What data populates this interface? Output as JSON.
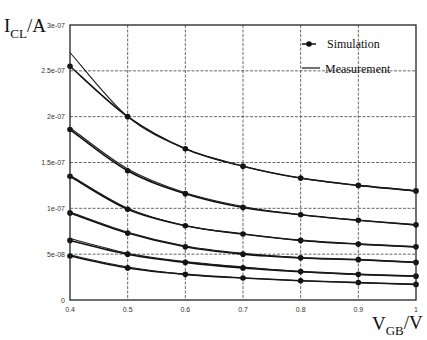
{
  "chart_data": {
    "type": "line",
    "title": "",
    "xlabel": "V_GB /V",
    "ylabel": "I_CL/A",
    "xlim": [
      0.4,
      1.0
    ],
    "ylim": [
      0,
      3e-07
    ],
    "grid": true,
    "legend_position": "upper right",
    "x": [
      0.4,
      0.5,
      0.6,
      0.7,
      0.8,
      0.9,
      1.0
    ],
    "x_tick_labels": [
      "0.4",
      "0.5",
      "0.6",
      "0.7",
      "0.8",
      "0.9",
      "1"
    ],
    "y_tick_values": [
      0,
      5e-08,
      1e-07,
      1.5e-07,
      2e-07,
      2.5e-07,
      3e-07
    ],
    "y_tick_labels": [
      "0",
      "5e-08",
      "1e-07",
      "1.5e-07",
      "2e-07",
      "2.5e-07",
      "3e-07"
    ],
    "legend": [
      {
        "name": "Simulation",
        "style": "line-with-dot-markers"
      },
      {
        "name": "Measurement",
        "style": "solid-line"
      }
    ],
    "series": [
      {
        "name": "Simulation curve 1",
        "values": [
          2.55e-07,
          2e-07,
          1.65e-07,
          1.46e-07,
          1.33e-07,
          1.25e-07,
          1.19e-07
        ]
      },
      {
        "name": "Measurement curve 1",
        "values": [
          2.7e-07,
          2e-07,
          1.65e-07,
          1.46e-07,
          1.33e-07,
          1.25e-07,
          1.19e-07
        ]
      },
      {
        "name": "Simulation curve 2",
        "values": [
          1.86e-07,
          1.41e-07,
          1.16e-07,
          1.01e-07,
          9.3e-08,
          8.7e-08,
          8.2e-08
        ]
      },
      {
        "name": "Measurement curve 2",
        "values": [
          1.88e-07,
          1.43e-07,
          1.17e-07,
          1.02e-07,
          9.3e-08,
          8.7e-08,
          8.2e-08
        ]
      },
      {
        "name": "Simulation curve 3",
        "values": [
          1.35e-07,
          9.9e-08,
          8.1e-08,
          7.2e-08,
          6.5e-08,
          6.1e-08,
          5.8e-08
        ]
      },
      {
        "name": "Measurement curve 3",
        "values": [
          1.36e-07,
          1e-07,
          8.1e-08,
          7.2e-08,
          6.5e-08,
          6.1e-08,
          5.8e-08
        ]
      },
      {
        "name": "Simulation curve 4",
        "values": [
          9.5e-08,
          7.3e-08,
          5.8e-08,
          5e-08,
          4.6e-08,
          4.4e-08,
          4.1e-08
        ]
      },
      {
        "name": "Measurement curve 4",
        "values": [
          9.6e-08,
          7.4e-08,
          5.9e-08,
          5.1e-08,
          4.6e-08,
          4.4e-08,
          4.1e-08
        ]
      },
      {
        "name": "Simulation curve 5",
        "values": [
          6.5e-08,
          5e-08,
          4.1e-08,
          3.5e-08,
          3.1e-08,
          2.8e-08,
          2.6e-08
        ]
      },
      {
        "name": "Measurement curve 5",
        "values": [
          6.7e-08,
          5.1e-08,
          4.2e-08,
          3.6e-08,
          3.1e-08,
          2.8e-08,
          2.6e-08
        ]
      },
      {
        "name": "Simulation curve 6",
        "values": [
          4.8e-08,
          3.5e-08,
          2.8e-08,
          2.4e-08,
          2.1e-08,
          1.9e-08,
          1.7e-08
        ]
      },
      {
        "name": "Measurement curve 6",
        "values": [
          4.9e-08,
          3.6e-08,
          2.8e-08,
          2.4e-08,
          2.1e-08,
          1.9e-08,
          1.7e-08
        ]
      }
    ]
  },
  "labels": {
    "y_axis_main": "I",
    "y_axis_sub": "CL",
    "y_axis_unit": "/A",
    "x_axis_main": "V",
    "x_axis_sub": "GB",
    "x_axis_unit": "/V",
    "legend_simulation": "Simulation",
    "legend_measurement": "Measurement"
  },
  "colors": {
    "curve": "#111111",
    "grid": "#444444",
    "background": "#ffffff"
  }
}
